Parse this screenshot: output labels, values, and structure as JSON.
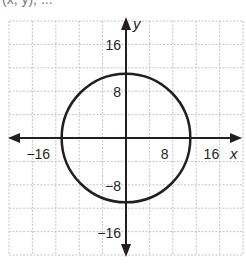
{
  "header_fragment": "(x, y), ...",
  "chart_data": {
    "type": "line",
    "title": "",
    "xlabel": "x",
    "ylabel": "y",
    "xlim": [
      -20,
      20
    ],
    "ylim": [
      -20,
      20
    ],
    "grid": true,
    "grid_step": 4,
    "shape": "circle",
    "center": [
      0,
      0
    ],
    "radius": 11,
    "x_ticks": [
      {
        "value": -16,
        "label": "−16"
      },
      {
        "value": 8,
        "label": "8"
      },
      {
        "value": 16,
        "label": "16"
      }
    ],
    "y_ticks": [
      {
        "value": 16,
        "label": "16"
      },
      {
        "value": 8,
        "label": "8"
      },
      {
        "value": -8,
        "label": "−8"
      },
      {
        "value": -16,
        "label": "−16"
      }
    ],
    "colors": {
      "curve": "#231f20",
      "axis": "#231f20",
      "grid": "#b5b5b5"
    }
  }
}
